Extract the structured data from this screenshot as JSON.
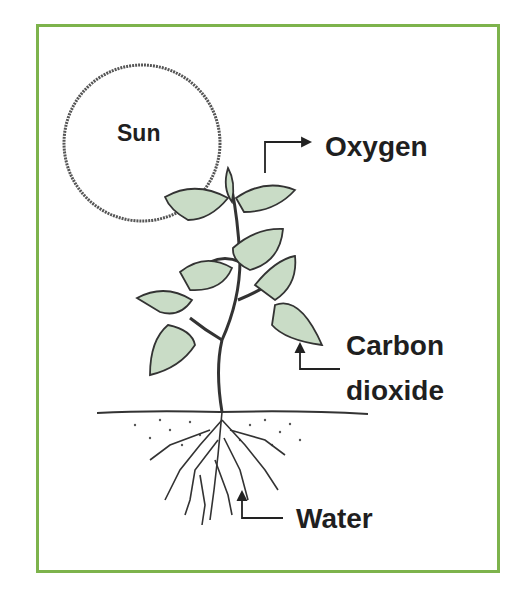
{
  "diagram": {
    "border_color": "#7db34c",
    "labels": {
      "sun": "Sun",
      "oxygen": "Oxygen",
      "carbon_dioxide_line1": "Carbon",
      "carbon_dioxide_line2": "dioxide",
      "water": "Water"
    },
    "colors": {
      "leaf_fill": "#c9dcc6",
      "leaf_stroke": "#333333",
      "text": "#1f1f1f"
    }
  }
}
